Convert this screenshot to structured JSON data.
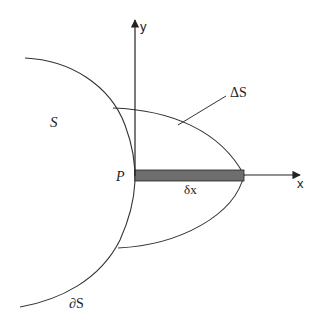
{
  "diagram": {
    "labels": {
      "region_S": "S",
      "region_delta_S": "ΔS",
      "boundary": "∂S",
      "point_P": "P",
      "strip_width": "δx",
      "x_axis": "x",
      "y_axis": "y"
    },
    "colors": {
      "stroke": "#333333",
      "strip_fill": "#6e6e6e",
      "background": "#ffffff"
    },
    "elements": [
      {
        "id": "boundary-curve",
        "desc": "Curved boundary ∂S of region S passing through point P"
      },
      {
        "id": "delta-s-region",
        "desc": "Lens-shaped region ΔS bounded by ∂S and a curve meeting x-axis"
      },
      {
        "id": "strip",
        "desc": "Thin shaded strip of width δx along x-axis from P"
      },
      {
        "id": "x-axis",
        "desc": "Horizontal axis starting at P with arrow"
      },
      {
        "id": "y-axis",
        "desc": "Vertical axis through P with arrow"
      }
    ]
  }
}
